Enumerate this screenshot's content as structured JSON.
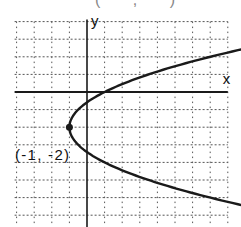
{
  "chart_data": {
    "type": "line",
    "title": "",
    "top_fragment": "( ,  )",
    "xlabel": "x",
    "ylabel": "y",
    "xlim": [
      -4,
      8
    ],
    "ylim": [
      -7,
      4
    ],
    "grid": true,
    "grid_style": "dotted",
    "equation": "x = 0.5(y + 2)^2 - 1",
    "series": [
      {
        "name": "parabola",
        "description": "Horizontal parabola opening right, vertex (-1, -2), crosses x-axis at (1, 0)",
        "points": [
          {
            "x": 8.68,
            "y": 2.4
          },
          {
            "x": 7,
            "y": 2
          },
          {
            "x": 3.5,
            "y": 1
          },
          {
            "x": 1,
            "y": 0
          },
          {
            "x": -0.5,
            "y": -1
          },
          {
            "x": -1,
            "y": -2
          },
          {
            "x": -0.5,
            "y": -3
          },
          {
            "x": 1,
            "y": -4
          },
          {
            "x": 3.5,
            "y": -5
          },
          {
            "x": 7,
            "y": -6
          },
          {
            "x": 8.68,
            "y": -6.4
          }
        ]
      }
    ],
    "annotations": [
      {
        "text": "(-1, -2)",
        "x": -1,
        "y": -2,
        "marker": "dot",
        "placement": "left-below"
      }
    ],
    "colors": {
      "curve": "#1a1a1a",
      "axis": "#1a1a1a",
      "grid": "#555555"
    }
  }
}
